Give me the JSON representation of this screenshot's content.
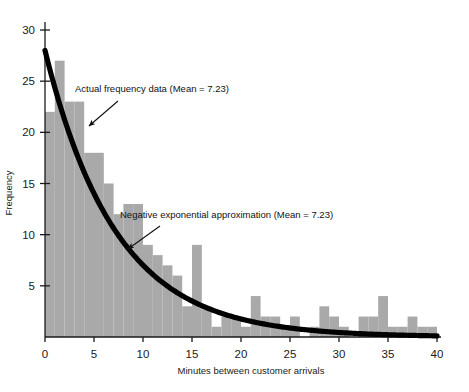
{
  "chart_data": {
    "type": "bar",
    "title": "",
    "xlabel": "Minutes between customer arrivals",
    "ylabel": "Frequency",
    "xlim": [
      0,
      40
    ],
    "ylim": [
      0,
      30
    ],
    "xticks": [
      0,
      5,
      10,
      15,
      20,
      25,
      30,
      35,
      40
    ],
    "yticks": [
      5,
      10,
      15,
      20,
      25,
      30
    ],
    "grid": false,
    "legend": "none",
    "bar_color": "#a9a9a9",
    "curve_color": "#000000",
    "bin_width": 1,
    "categories": [
      0,
      1,
      2,
      3,
      4,
      5,
      6,
      7,
      8,
      9,
      10,
      11,
      12,
      13,
      14,
      15,
      16,
      17,
      18,
      19,
      20,
      21,
      22,
      23,
      24,
      25,
      26,
      27,
      28,
      29,
      30,
      31,
      32,
      33,
      34,
      35,
      36,
      37,
      38,
      39
    ],
    "values": [
      22,
      27,
      23,
      23,
      18,
      18,
      15,
      12,
      13,
      13,
      9,
      8,
      7,
      6,
      3,
      9,
      3,
      1,
      2,
      2,
      1,
      4,
      2,
      2,
      1,
      2,
      0,
      1,
      3,
      2,
      1,
      0,
      2,
      2,
      4,
      1,
      1,
      2,
      1,
      1
    ],
    "series": [
      {
        "name": "Actual frequency data",
        "type": "bar",
        "mean": 7.23,
        "values": [
          22,
          27,
          23,
          23,
          18,
          18,
          15,
          12,
          13,
          13,
          9,
          8,
          7,
          6,
          3,
          9,
          3,
          1,
          2,
          2,
          1,
          4,
          2,
          2,
          1,
          2,
          0,
          1,
          3,
          2,
          1,
          0,
          2,
          2,
          4,
          1,
          1,
          2,
          1,
          1
        ]
      },
      {
        "name": "Negative exponential approximation",
        "type": "line",
        "mean": 7.23,
        "y0": 28.0,
        "decay_rate": 7.23,
        "formula": "y = 28.0 * exp(-x / 7.23)"
      }
    ],
    "annotations": [
      {
        "id": "actual-data-annotation",
        "text": "Actual frequency data (Mean = 7.23)",
        "text_x": 75,
        "text_y": 92,
        "arrow_from_x": 118,
        "arrow_from_y": 101,
        "arrow_to_x": 89,
        "arrow_to_y": 126
      },
      {
        "id": "exponential-annotation",
        "text": "Negative exponential approximation (Mean = 7.23)",
        "text_x": 120,
        "text_y": 218,
        "arrow_from_x": 160,
        "arrow_from_y": 226,
        "arrow_to_x": 128,
        "arrow_to_y": 249
      }
    ]
  },
  "axis": {
    "x_tick_labels": [
      "0",
      "5",
      "10",
      "15",
      "20",
      "25",
      "30",
      "35",
      "40"
    ],
    "y_tick_labels": [
      "5",
      "10",
      "15",
      "20",
      "25",
      "30"
    ],
    "x_title": "Minutes between customer arrivals",
    "y_title": "Frequency"
  }
}
